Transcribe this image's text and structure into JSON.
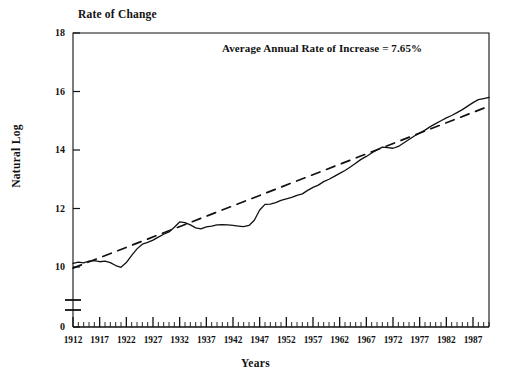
{
  "chart_data": {
    "type": "line",
    "title": "Rate of Change",
    "xlabel": "Years",
    "ylabel": "Natural Log",
    "annotation": "Average Annual Rate of Increase = 7.65%",
    "grid": false,
    "legend": "none",
    "axis_break": true,
    "xlim": [
      1912,
      1990
    ],
    "ylim": [
      0,
      18
    ],
    "yticks": [
      "0",
      "10",
      "12",
      "14",
      "16",
      "18"
    ],
    "ytick_values": [
      0,
      10,
      12,
      14,
      16,
      18
    ],
    "xticks": [
      "1912",
      "1917",
      "1922",
      "1927",
      "1932",
      "1937",
      "1942",
      "1947",
      "1952",
      "1957",
      "1962",
      "1967",
      "1972",
      "1977",
      "1982",
      "1987"
    ],
    "xtick_values": [
      1912,
      1917,
      1922,
      1927,
      1932,
      1937,
      1942,
      1947,
      1952,
      1957,
      1962,
      1967,
      1972,
      1977,
      1982,
      1987
    ],
    "minor_tick_interval": 1,
    "line_color": "#111111",
    "series": [
      {
        "name": "Natural Log of Series",
        "style": "solid",
        "x": [
          1912,
          1913,
          1914,
          1915,
          1916,
          1917,
          1918,
          1919,
          1920,
          1921,
          1922,
          1923,
          1924,
          1925,
          1926,
          1927,
          1928,
          1929,
          1930,
          1931,
          1932,
          1933,
          1934,
          1935,
          1936,
          1937,
          1938,
          1939,
          1940,
          1941,
          1942,
          1943,
          1944,
          1945,
          1946,
          1947,
          1948,
          1949,
          1950,
          1951,
          1952,
          1953,
          1954,
          1955,
          1956,
          1957,
          1958,
          1959,
          1960,
          1961,
          1962,
          1963,
          1964,
          1965,
          1966,
          1967,
          1968,
          1969,
          1970,
          1971,
          1972,
          1973,
          1974,
          1975,
          1976,
          1977,
          1978,
          1979,
          1980,
          1981,
          1982,
          1983,
          1984,
          1985,
          1986,
          1987,
          1988,
          1989,
          1990
        ],
        "y": [
          10.12,
          10.17,
          10.14,
          10.2,
          10.22,
          10.18,
          10.2,
          10.15,
          10.05,
          9.93,
          10.15,
          10.4,
          10.62,
          10.78,
          10.84,
          10.92,
          11.02,
          11.12,
          11.2,
          11.36,
          11.54,
          11.52,
          11.44,
          11.34,
          11.3,
          11.37,
          11.4,
          11.44,
          11.45,
          11.44,
          11.42,
          11.4,
          11.38,
          11.42,
          11.6,
          11.95,
          12.14,
          12.15,
          12.2,
          12.28,
          12.33,
          12.38,
          12.45,
          12.5,
          12.62,
          12.72,
          12.8,
          12.92,
          13.0,
          13.1,
          13.2,
          13.3,
          13.42,
          13.55,
          13.68,
          13.78,
          13.9,
          14.0,
          14.1,
          14.08,
          14.06,
          14.12,
          14.24,
          14.36,
          14.48,
          14.58,
          14.68,
          14.8,
          14.9,
          15.0,
          15.1,
          15.18,
          15.28,
          15.38,
          15.5,
          15.62,
          15.72,
          15.76,
          15.8
        ]
      },
      {
        "name": "Average Annual Rate of Increase Trend",
        "style": "dashed",
        "x": [
          1912,
          1990
        ],
        "y": [
          9.72,
          15.5
        ]
      }
    ]
  },
  "meta": {
    "background_color": "#ffffff",
    "text_color": "#111111"
  }
}
